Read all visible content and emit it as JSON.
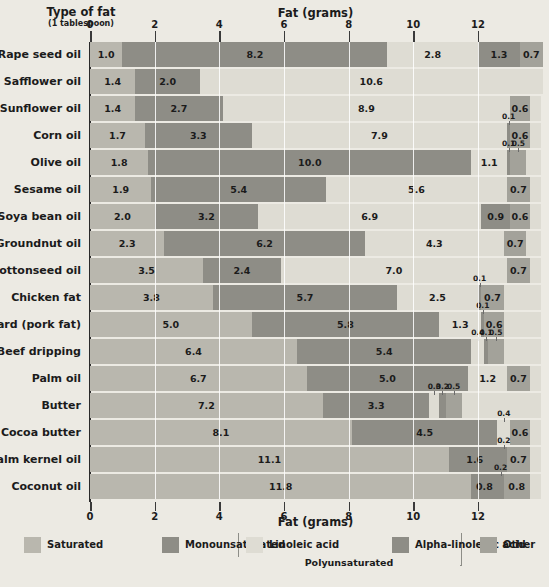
{
  "header": {
    "row_axis_title": "Type of fat",
    "row_axis_subtitle": "(1 tablespoon)",
    "value_axis_title_top": "Fat (grams)",
    "value_axis_title_bottom": "Fat (grams)"
  },
  "legend": {
    "polyunsaturated_bracket_label": "Polyunsaturated",
    "items": [
      {
        "label": "Saturated",
        "color": "#b9b7ae"
      },
      {
        "label": "Monounsaturated",
        "color": "#8e8d86"
      },
      {
        "label": "Linoleic acid",
        "color": "#dedcd3"
      },
      {
        "label": "Alpha-linolenic acid",
        "color": "#8e8d86"
      },
      {
        "label": "Other",
        "color": "#a3a29a"
      }
    ]
  },
  "chart_data": {
    "type": "bar",
    "orientation": "horizontal",
    "stacked": true,
    "title": "Fat (grams)",
    "xlabel": "Fat (grams)",
    "ylabel": "Type of fat (1 tablespoon)",
    "xlim": [
      0,
      13.95
    ],
    "xticks": [
      0,
      2,
      4,
      6,
      8,
      10,
      12
    ],
    "xticklabels": [
      "0",
      "2",
      "4",
      "6",
      "8",
      "10",
      "12"
    ],
    "grid": true,
    "legend_position": "bottom",
    "series": [
      {
        "name": "Saturated",
        "color": "#b9b7ae"
      },
      {
        "name": "Monounsaturated",
        "color": "#8e8d86"
      },
      {
        "name": "Linoleic acid",
        "color": "#dedcd3"
      },
      {
        "name": "Alpha-linolenic acid",
        "color": "#8e8d86"
      },
      {
        "name": "Other",
        "color": "#a3a29a"
      }
    ],
    "categories": [
      "Rape seed oil",
      "Safflower oil",
      "Sunflower oil",
      "Corn oil",
      "Olive oil",
      "Sesame oil",
      "Soya bean oil",
      "Groundnut oil",
      "Cottonseed oil",
      "Chicken fat",
      "Lard (pork fat)",
      "Beef dripping",
      "Palm oil",
      "Butter",
      "Cocoa butter",
      "Palm kernel oil",
      "Coconut oil"
    ],
    "rows": [
      {
        "category": "Rape seed oil",
        "values": [
          1.0,
          8.2,
          2.8,
          1.3,
          0.7
        ],
        "labels": [
          "1.0",
          "8.2",
          "2.8",
          "1.3",
          "0.7"
        ]
      },
      {
        "category": "Safflower oil",
        "values": [
          1.4,
          2.0,
          10.6,
          0.0,
          0.0
        ],
        "labels": [
          "1.4",
          "2.0",
          "10.6",
          "",
          ""
        ]
      },
      {
        "category": "Sunflower oil",
        "values": [
          1.4,
          2.7,
          8.9,
          0.0,
          0.6
        ],
        "labels": [
          "1.4",
          "2.7",
          "8.9",
          "",
          "0.6"
        ]
      },
      {
        "category": "Corn oil",
        "values": [
          1.7,
          3.3,
          7.9,
          0.1,
          0.6
        ],
        "labels": [
          "1.7",
          "3.3",
          "7.9",
          "0.1",
          "0.6"
        ]
      },
      {
        "category": "Olive oil",
        "values": [
          1.8,
          10.0,
          1.1,
          0.1,
          0.5
        ],
        "labels": [
          "1.8",
          "10.0",
          "1.1",
          "0.1",
          "0.5"
        ]
      },
      {
        "category": "Sesame oil",
        "values": [
          1.9,
          5.4,
          5.6,
          0.0,
          0.7
        ],
        "labels": [
          "1.9",
          "5.4",
          "5.6",
          "",
          "0.7"
        ]
      },
      {
        "category": "Soya bean oil",
        "values": [
          2.0,
          3.2,
          6.9,
          0.9,
          0.6
        ],
        "labels": [
          "2.0",
          "3.2",
          "6.9",
          "0.9",
          "0.6"
        ]
      },
      {
        "category": "Groundnut oil",
        "values": [
          2.3,
          6.2,
          4.3,
          0.0,
          0.7
        ],
        "labels": [
          "2.3",
          "6.2",
          "4.3",
          "",
          "0.7"
        ]
      },
      {
        "category": "Cottonseed oil",
        "values": [
          3.5,
          2.4,
          7.0,
          0.0,
          0.7
        ],
        "labels": [
          "3.5",
          "2.4",
          "7.0",
          "",
          "0.7"
        ]
      },
      {
        "category": "Chicken fat",
        "values": [
          3.8,
          5.7,
          2.5,
          0.1,
          0.7
        ],
        "labels": [
          "3.8",
          "5.7",
          "2.5",
          "0.1",
          "0.7"
        ]
      },
      {
        "category": "Lard (pork fat)",
        "values": [
          5.0,
          5.8,
          1.3,
          0.1,
          0.6
        ],
        "labels": [
          "5.0",
          "5.8",
          "1.3",
          "0.1",
          "0.6"
        ]
      },
      {
        "category": "Beef dripping",
        "values": [
          6.4,
          5.4,
          0.4,
          0.1,
          0.5
        ],
        "labels": [
          "6.4",
          "5.4",
          "0.4",
          "0.1",
          "0.5"
        ]
      },
      {
        "category": "Palm oil",
        "values": [
          6.7,
          5.0,
          1.2,
          0.0,
          0.7
        ],
        "labels": [
          "6.7",
          "5.0",
          "1.2",
          "",
          "0.7"
        ]
      },
      {
        "category": "Butter",
        "values": [
          7.2,
          3.3,
          0.3,
          0.2,
          0.5
        ],
        "labels": [
          "7.2",
          "3.3",
          "0.3",
          "0.2",
          "0.5"
        ]
      },
      {
        "category": "Cocoa butter",
        "values": [
          8.1,
          4.5,
          0.4,
          0.0,
          0.6
        ],
        "labels": [
          "8.1",
          "4.5",
          "0.4",
          "",
          "0.6"
        ]
      },
      {
        "category": "Palm kernel oil",
        "values": [
          11.1,
          1.6,
          0.0,
          0.2,
          0.7
        ],
        "labels": [
          "11.1",
          "1.6",
          "",
          "0.2",
          "0.7"
        ]
      },
      {
        "category": "Coconut oil",
        "values": [
          11.8,
          0.8,
          0.0,
          0.2,
          0.8
        ],
        "labels": [
          "11.8",
          "0.8",
          "",
          "0.2",
          "0.8"
        ]
      }
    ]
  }
}
